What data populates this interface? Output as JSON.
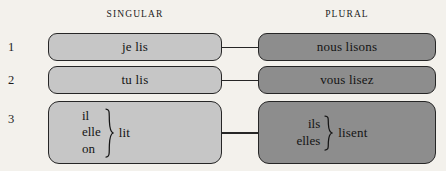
{
  "headers": {
    "singular": "SINGULAR",
    "plural": "PLURAL"
  },
  "colors": {
    "background": "#f3f1ec",
    "singular_box": "#c6c6c6",
    "plural_box": "#8d8d8d",
    "border": "#262626",
    "text": "#141414"
  },
  "rows": [
    {
      "number": "1",
      "singular": {
        "text": "je lis"
      },
      "plural": {
        "text": "nous lisons"
      }
    },
    {
      "number": "2",
      "singular": {
        "text": "tu lis"
      },
      "plural": {
        "text": "vous lisez"
      }
    },
    {
      "number": "3",
      "singular": {
        "pronouns": [
          "il",
          "elle",
          "on"
        ],
        "verb": "lit",
        "brace": "right-curly-brace"
      },
      "plural": {
        "pronouns": [
          "ils",
          "elles"
        ],
        "verb": "lisent",
        "brace": "right-curly-brace"
      }
    }
  ]
}
